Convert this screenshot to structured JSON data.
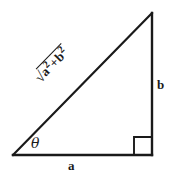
{
  "figure": {
    "type": "right-triangle-diagram",
    "background_color": "#ffffff",
    "stroke_color": "#1a1a1a",
    "labels": {
      "base": "a",
      "height": "b",
      "angle": "θ",
      "hypotenuse_radical_sign": "√",
      "hypotenuse_radicand_first_base": "a",
      "hypotenuse_radicand_first_exp": "2",
      "hypotenuse_operator": "+",
      "hypotenuse_radicand_second_base": "b",
      "hypotenuse_radicand_second_exp": "2",
      "hypotenuse_full": "√(a² + b²)"
    },
    "geometry": {
      "vertex_bottom_left": [
        13,
        155
      ],
      "vertex_bottom_right": [
        152,
        155
      ],
      "vertex_top_right": [
        152,
        13
      ],
      "right_angle_marker_size": 18,
      "hypotenuse_angle_degrees": -45.6,
      "stroke_width": 2.2
    }
  }
}
